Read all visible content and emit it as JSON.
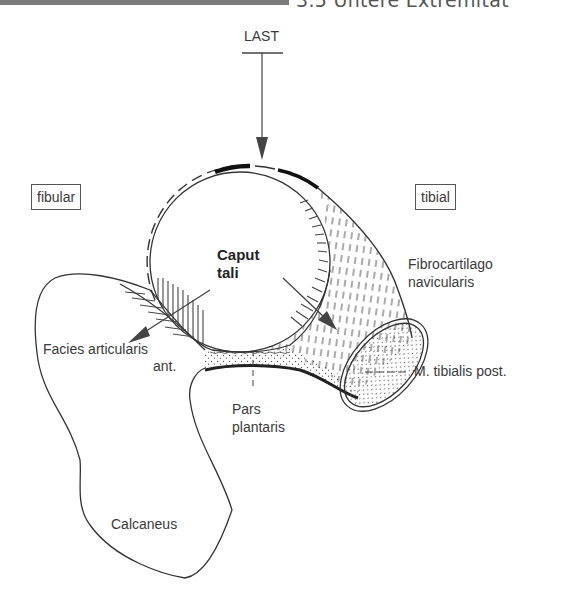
{
  "header": {
    "section_title": "3.5 Untere Extremität"
  },
  "diagram": {
    "load_label": "LAST",
    "side_labels": {
      "fibular": "fibular",
      "tibial": "tibial"
    },
    "structures": {
      "caput_tali_line1": "Caput",
      "caput_tali_line2": "tali",
      "fibrocartilago_line1": "Fibrocartilago",
      "fibrocartilago_line2": "navicularis",
      "facies_line1": "Facies articularis",
      "facies_line2": "ant.",
      "tibialis": "M. tibialis post.",
      "pars_line1": "Pars",
      "pars_line2": "plantaris",
      "calcaneus": "Calcaneus"
    },
    "colors": {
      "line": "#333333",
      "header_bar": "#7a7a7a",
      "arrow": "#555555"
    }
  }
}
